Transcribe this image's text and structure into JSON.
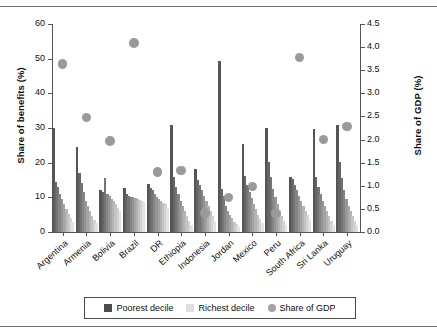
{
  "chart_data": {
    "type": "bar",
    "title": "",
    "xlabel": "",
    "ylabel": "Share of benefits (%)",
    "y2label": "Share of GDP (%)",
    "ylim": [
      0,
      60
    ],
    "y2lim": [
      0,
      4.5
    ],
    "yticks": [
      "0",
      "10",
      "20",
      "30",
      "40",
      "50",
      "60"
    ],
    "y2ticks": [
      "0.0",
      "0.5",
      "1.0",
      "1.5",
      "2.0",
      "2.5",
      "3.0",
      "3.5",
      "4.0",
      "4.5"
    ],
    "grid": false,
    "legend_position": "bottom",
    "categories": [
      "Argentina",
      "Armenia",
      "Bolivia",
      "Brazil",
      "DR",
      "Ethiopia",
      "Indonesia",
      "Jordan",
      "Mexico",
      "Peru",
      "South Africa",
      "Sri Lanka",
      "Uruguay"
    ],
    "decile_series_note": "Each country shows 10 bars, poorest decile (dark, left) to richest decile (light, right)",
    "deciles": [
      {
        "country": "Argentina",
        "values": [
          30.0,
          14.5,
          13.0,
          11.0,
          9.5,
          8.0,
          6.5,
          5.2,
          4.0,
          2.8
        ]
      },
      {
        "country": "Armenia",
        "values": [
          24.5,
          17.0,
          14.0,
          11.5,
          9.0,
          7.5,
          6.0,
          4.5,
          3.5,
          2.5
        ]
      },
      {
        "country": "Bolivia",
        "values": [
          12.0,
          11.5,
          15.5,
          11.0,
          10.5,
          9.5,
          9.0,
          8.0,
          7.0,
          6.0
        ]
      },
      {
        "country": "Brazil",
        "values": [
          12.8,
          11.0,
          10.5,
          10.0,
          10.0,
          9.7,
          9.5,
          9.2,
          9.0,
          8.8
        ]
      },
      {
        "country": "DR",
        "values": [
          13.8,
          12.8,
          12.0,
          11.0,
          10.0,
          9.5,
          9.0,
          8.5,
          8.0,
          7.0
        ]
      },
      {
        "country": "Ethiopia",
        "values": [
          31.0,
          15.8,
          13.0,
          11.0,
          9.0,
          7.5,
          6.0,
          4.5,
          3.2,
          2.0
        ]
      },
      {
        "country": "Indonesia",
        "values": [
          18.2,
          15.0,
          13.5,
          12.0,
          10.5,
          9.0,
          7.5,
          6.0,
          4.5,
          3.2
        ]
      },
      {
        "country": "Jordan",
        "values": [
          49.2,
          12.3,
          10.5,
          7.5,
          6.0,
          5.0,
          4.0,
          3.0,
          2.2,
          1.5
        ]
      },
      {
        "country": "Mexico",
        "values": [
          25.3,
          16.2,
          13.5,
          11.5,
          9.8,
          8.0,
          6.5,
          5.0,
          3.8,
          2.5
        ]
      },
      {
        "country": "Peru",
        "values": [
          30.0,
          20.3,
          16.0,
          12.5,
          10.0,
          8.0,
          6.2,
          4.5,
          3.2,
          2.0
        ]
      },
      {
        "country": "South Africa",
        "values": [
          15.8,
          15.2,
          13.5,
          12.0,
          10.5,
          9.0,
          7.5,
          6.0,
          4.8,
          3.5
        ]
      },
      {
        "country": "Sri Lanka",
        "values": [
          29.8,
          16.0,
          13.0,
          11.0,
          9.0,
          7.5,
          6.0,
          4.5,
          3.2,
          2.0
        ]
      },
      {
        "country": "Uruguay",
        "values": [
          31.0,
          20.3,
          15.5,
          12.0,
          9.5,
          7.5,
          6.0,
          4.5,
          3.2,
          2.0
        ]
      }
    ],
    "share_of_gdp": [
      {
        "country": "Argentina",
        "value": 3.63
      },
      {
        "country": "Armenia",
        "value": 2.48
      },
      {
        "country": "Bolivia",
        "value": 1.97
      },
      {
        "country": "Brazil",
        "value": 4.09
      },
      {
        "country": "DR",
        "value": 1.3
      },
      {
        "country": "Ethiopia",
        "value": 1.33
      },
      {
        "country": "Indonesia",
        "value": 0.41
      },
      {
        "country": "Jordan",
        "value": 0.75
      },
      {
        "country": "Mexico",
        "value": 0.98
      },
      {
        "country": "Peru",
        "value": 0.4
      },
      {
        "country": "South Africa",
        "value": 3.77
      },
      {
        "country": "Sri Lanka",
        "value": 2.0
      },
      {
        "country": "Uruguay",
        "value": 2.28
      }
    ],
    "legend": [
      {
        "label": "Poorest decile",
        "marker": "square",
        "color": "#4c4c4c"
      },
      {
        "label": "Richest decile",
        "marker": "square",
        "color": "#dedede"
      },
      {
        "label": "Share of GDP",
        "marker": "circle",
        "color": "#a2a2a2"
      }
    ]
  }
}
